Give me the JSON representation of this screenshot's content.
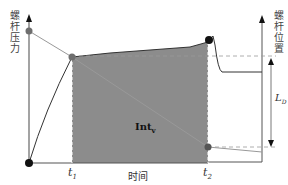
{
  "diagram": {
    "left_axis_label": "螺杆压力",
    "right_axis_label": "螺杆位置",
    "x_axis_label": "时间",
    "t1_label": "t",
    "t1_sub": "1",
    "t2_label": "t",
    "t2_sub": "2",
    "area_label": "Int",
    "area_sub": "v",
    "distance_label": "L",
    "distance_sub": "D",
    "colors": {
      "shaded_area": "#8c8c8c",
      "axis": "#555555",
      "dot_dark": "#111111",
      "dot_gray": "#6e6e6e",
      "dashed": "#999999"
    }
  }
}
